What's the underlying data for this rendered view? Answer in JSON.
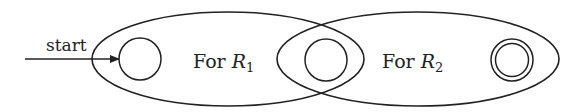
{
  "diagram": {
    "start_label": "start",
    "region1": {
      "prefix": "For ",
      "var": "R",
      "sub": "1"
    },
    "region2": {
      "prefix": "For ",
      "var": "R",
      "sub": "2"
    },
    "colors": {
      "stroke": "#222222",
      "background": "#ffffff"
    },
    "states": [
      {
        "id": "start-state",
        "accepting": false
      },
      {
        "id": "shared-state",
        "accepting": false
      },
      {
        "id": "accept-state",
        "accepting": true
      }
    ]
  }
}
